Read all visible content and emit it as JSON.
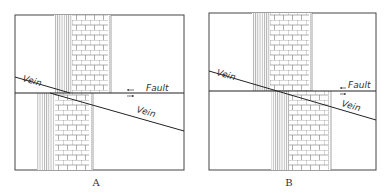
{
  "figure": {
    "panels": [
      {
        "id": "A",
        "caption": "A",
        "labels": {
          "vein_upper": "Vein",
          "vein_lower": "Vein",
          "fault": "Fault"
        },
        "frame": {
          "x": 15,
          "y": 15,
          "w": 169,
          "h": 155
        },
        "fault_y": 93,
        "upper_block": {
          "lines_x": [
            54,
            72
          ],
          "brick_x": [
            72,
            108
          ],
          "dots_x": [
            108,
            111
          ]
        },
        "lower_block": {
          "lines_x": [
            37,
            55
          ],
          "brick_x": [
            55,
            89
          ],
          "dots_x": [
            89,
            93
          ]
        },
        "vein": {
          "x1": 15,
          "y1": 77,
          "x2": 184,
          "y2": 131
        },
        "fault_motion": "upper block left, lower block right"
      },
      {
        "id": "B",
        "caption": "B",
        "labels": {
          "vein_upper": "Vein",
          "vein_lower": "Vein",
          "fault": "Fault"
        },
        "frame": {
          "x": 209,
          "y": 13,
          "w": 167,
          "h": 157
        },
        "fault_y": 91,
        "upper_block": {
          "lines_x": [
            252,
            270
          ],
          "brick_x": [
            270,
            309
          ],
          "dots_x": [
            309,
            312
          ]
        },
        "lower_block": {
          "lines_x": [
            271,
            289
          ],
          "brick_x": [
            289,
            328
          ],
          "dots_x": [
            328,
            331
          ]
        },
        "vein": {
          "x1": 209,
          "y1": 71,
          "x2": 376,
          "y2": 120
        },
        "fault_motion": "upper block left, lower block right"
      }
    ]
  }
}
